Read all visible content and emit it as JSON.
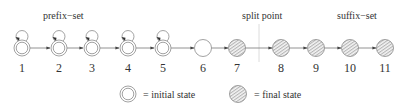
{
  "diagram": {
    "annotations": {
      "prefix_set": "prefix−set",
      "split_point": "split point",
      "suffix_set": "suffix−set"
    },
    "states": [
      {
        "id": "1",
        "type": "initial",
        "self_loop": true
      },
      {
        "id": "2",
        "type": "initial",
        "self_loop": true
      },
      {
        "id": "3",
        "type": "initial",
        "self_loop": true
      },
      {
        "id": "4",
        "type": "initial",
        "self_loop": true
      },
      {
        "id": "5",
        "type": "initial",
        "self_loop": true
      },
      {
        "id": "6",
        "type": "plain",
        "self_loop": false
      },
      {
        "id": "7",
        "type": "final",
        "self_loop": false
      },
      {
        "id": "8",
        "type": "final",
        "self_loop": false
      },
      {
        "id": "9",
        "type": "final",
        "self_loop": false
      },
      {
        "id": "10",
        "type": "final",
        "self_loop": false
      },
      {
        "id": "11",
        "type": "final",
        "self_loop": false
      }
    ],
    "transitions": [
      [
        "1",
        "2"
      ],
      [
        "2",
        "3"
      ],
      [
        "3",
        "4"
      ],
      [
        "4",
        "5"
      ],
      [
        "5",
        "6"
      ],
      [
        "6",
        "7"
      ],
      [
        "7",
        "8"
      ],
      [
        "8",
        "9"
      ],
      [
        "9",
        "10"
      ],
      [
        "10",
        "11"
      ]
    ],
    "legend": {
      "initial": "= initial state",
      "final": "= final state"
    },
    "colors": {
      "stroke": "#8a8a8a",
      "text": "#333333",
      "hatch": "#9a9a9a",
      "split_line": "#dddddd"
    }
  }
}
